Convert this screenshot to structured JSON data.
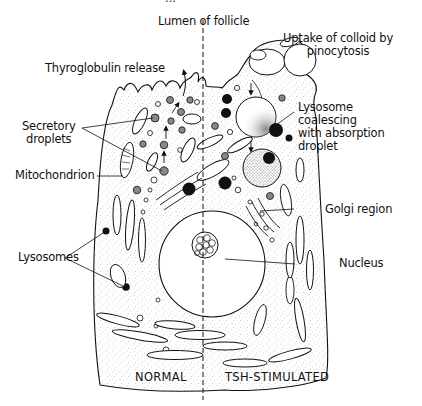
{
  "figure": {
    "cropped_top_text": "...",
    "divider": "dashed vertical line separating normal and TSH-stimulated halves",
    "labels": {
      "lumen": "Lumen of follicle",
      "uptake_line1": "Uptake of colloid by",
      "uptake_line2": "pinocytosis",
      "thyroglobulin": "Thyroglobulin release",
      "secretory_line1": "Secretory",
      "secretory_line2": "droplets",
      "lysosome_line1": "Lysosome",
      "lysosome_line2": "coalescing",
      "lysosome_line3": "with absorption",
      "lysosome_line4": "droplet",
      "mitochondrion": "Mitochondrion",
      "golgi": "Golgi region",
      "lysosomes": "Lysosomes",
      "nucleus": "Nucleus",
      "normal": "NORMAL",
      "tsh": "TSH-STIMULATED"
    },
    "colors": {
      "ink": "#111111",
      "stipple": "#8a8a8a",
      "background": "#ffffff"
    }
  }
}
